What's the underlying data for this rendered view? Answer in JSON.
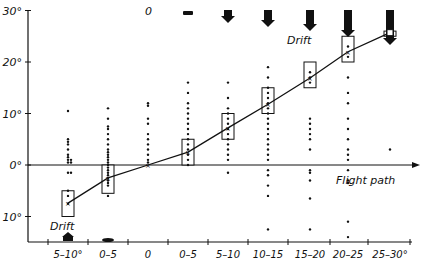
{
  "chart_data": {
    "type": "scatter",
    "title": "",
    "xlabel": "",
    "ylabel": "",
    "ylim": [
      -15,
      30
    ],
    "yticks": [
      "30°",
      "20°",
      "10°",
      "0°",
      "10°"
    ],
    "annotations": {
      "drift_top": "Drift",
      "drift_bottom": "Drift",
      "flight_path": "Flight path",
      "top_zero": "0"
    },
    "categories": [
      "5-10°",
      "0-5",
      "0",
      "0-5",
      "5-10",
      "10-15",
      "15-20",
      "20-25",
      "25-30°"
    ],
    "drift_side": [
      "bottom",
      "bottom",
      "none",
      "top",
      "top",
      "top",
      "top",
      "top",
      "top"
    ],
    "series": [
      {
        "name": "mean heading deviation",
        "values": [
          -7.4,
          -2.5,
          0,
          2.5,
          7.2,
          11.8,
          16.9,
          22.0,
          25.7
        ]
      },
      {
        "name": "box range (low)",
        "values": [
          -10,
          -5.5,
          0,
          0,
          5,
          10,
          15,
          20,
          25
        ]
      },
      {
        "name": "box range (high)",
        "values": [
          -5,
          0,
          0,
          5,
          10,
          15,
          20,
          25,
          26
        ]
      }
    ],
    "individual_points": [
      [
        10.5,
        5,
        4.5,
        4,
        3,
        2,
        1.5,
        1,
        1,
        0.5,
        0.5,
        -1.5,
        -1.5,
        -5,
        -6,
        -7.5
      ],
      [
        11,
        9,
        7.5,
        7,
        6,
        5,
        4,
        3,
        2.5,
        2,
        1.5,
        1,
        0.5,
        0,
        -0.5,
        -1,
        -1.5,
        -2,
        -2.5,
        -3,
        -3.5,
        -4,
        -6
      ],
      [
        12,
        11.5,
        9,
        8,
        6,
        5,
        4,
        3,
        2,
        1,
        0.5
      ],
      [
        16,
        14,
        12,
        11,
        10,
        9,
        8,
        7,
        6,
        5,
        4,
        3,
        2,
        1,
        0
      ],
      [
        16,
        13,
        11,
        10,
        9,
        8,
        7,
        6,
        5,
        4,
        3,
        2,
        1,
        -1.5
      ],
      [
        19,
        17,
        15,
        14,
        13,
        12,
        11,
        10,
        9,
        8,
        7,
        6,
        5,
        4,
        3,
        2,
        1,
        -1,
        -2,
        -4,
        -6,
        -12.5
      ],
      [
        18,
        17,
        16,
        9,
        8,
        7,
        6,
        5,
        3,
        -1,
        -1.5,
        -3,
        -6.5,
        -12.5
      ],
      [
        23,
        21,
        17,
        14,
        12,
        9,
        7,
        5,
        3,
        2,
        1,
        -1,
        -3,
        -3.5,
        -11,
        -14
      ],
      [
        26,
        3
      ]
    ]
  },
  "layout": {
    "y_axis_x": 28,
    "y_zero_px": 165,
    "px_per_deg": 5.15
  }
}
